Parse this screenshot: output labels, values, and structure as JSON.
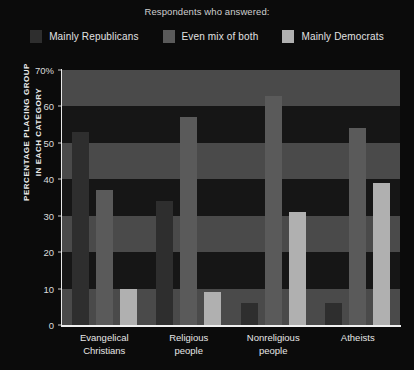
{
  "legend": {
    "title": "Respondents who answered:",
    "items": [
      {
        "label": "Mainly Republicans",
        "color": "#2e2e2e"
      },
      {
        "label": "Even mix of both",
        "color": "#5a5a5a"
      },
      {
        "label": "Mainly Democrats",
        "color": "#b0b0b0"
      }
    ]
  },
  "axis": {
    "ylabel_line1": "PERCENTAGE PLACING GROUP",
    "ylabel_line2": "IN EACH CATEGORY",
    "yticks": [
      "70%",
      "60",
      "50",
      "40",
      "30",
      "20",
      "10",
      "0"
    ]
  },
  "chart_data": {
    "type": "bar",
    "title": "Respondents who answered:",
    "xlabel": "",
    "ylabel": "PERCENTAGE PLACING GROUP IN EACH CATEGORY",
    "ylim": [
      0,
      70
    ],
    "ytick_values": [
      0,
      10,
      20,
      30,
      40,
      50,
      60,
      70
    ],
    "grid": "horizontal-bands",
    "legend_position": "top-center",
    "categories": [
      "Evangelical Christians",
      "Religious people",
      "Nonreligious people",
      "Atheists"
    ],
    "series": [
      {
        "name": "Mainly Republicans",
        "color": "#2e2e2e",
        "values": [
          53,
          34,
          6,
          6
        ]
      },
      {
        "name": "Even mix of both",
        "color": "#5a5a5a",
        "values": [
          37,
          57,
          63,
          54
        ]
      },
      {
        "name": "Mainly Democrats",
        "color": "#b0b0b0",
        "values": [
          10,
          9,
          31,
          39
        ]
      }
    ]
  },
  "style": {
    "background": "#0b0b0b",
    "band_light": "#4a4a4a",
    "band_dark": "#161616",
    "axis_color": "#f0f0f0"
  }
}
